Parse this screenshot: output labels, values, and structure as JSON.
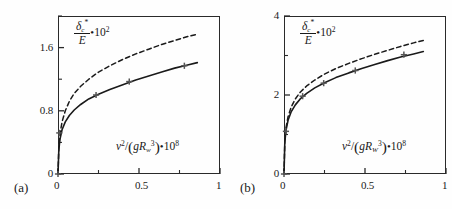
{
  "figure": {
    "panels": [
      {
        "label": "(a)",
        "y_axis": {
          "title_numerator": "δ",
          "title_numerator_sub": "c",
          "title_numerator_sup": "*",
          "title_denominator": "E",
          "title_suffix_dot": "•",
          "title_suffix": "10",
          "title_suffix_exp": "2",
          "ticks": [
            "0",
            "0.8",
            "1.6"
          ],
          "tick_values": [
            0,
            0.8,
            1.6
          ],
          "minor_tick_values": [
            0.4,
            1.2,
            2.0
          ],
          "limits": [
            0,
            2.0
          ]
        },
        "x_axis": {
          "title_var": "v",
          "title_var_exp": "2",
          "title_slash": "/",
          "title_open": "(",
          "title_g": "g",
          "title_R": "R",
          "title_R_sub": "w",
          "title_R_exp": "3",
          "title_close": ")",
          "title_dot": "•",
          "title_ten": "10",
          "title_ten_exp": "8",
          "ticks": [
            "0",
            "0.5",
            "1"
          ],
          "tick_values": [
            0,
            0.5,
            1
          ],
          "minor_tick_values": [
            0.25,
            0.75
          ],
          "limits": [
            0,
            1
          ]
        }
      },
      {
        "label": "(b)",
        "y_axis": {
          "title_numerator": "δ",
          "title_numerator_sub": "c",
          "title_numerator_sup": "*",
          "title_denominator": "E",
          "title_suffix_dot": "•",
          "title_suffix": "10",
          "title_suffix_exp": "2",
          "ticks": [
            "0",
            "2",
            "4"
          ],
          "tick_values": [
            0,
            2,
            4
          ],
          "minor_tick_values": [
            1,
            3
          ],
          "limits": [
            0,
            4
          ]
        },
        "x_axis": {
          "title_var": "v",
          "title_var_exp": "2",
          "title_slash": "/",
          "title_open": "(",
          "title_g": "g",
          "title_R": "R",
          "title_R_sub": "W",
          "title_R_exp": "3",
          "title_close": ")",
          "title_dot": "•",
          "title_ten": "10",
          "title_ten_exp": "8",
          "ticks": [
            "0",
            "0.5",
            "1"
          ],
          "tick_values": [
            0,
            0.5,
            1
          ],
          "minor_tick_values": [
            0.25,
            0.75
          ],
          "limits": [
            0,
            1
          ]
        }
      }
    ],
    "colors": {
      "axis": "#2a2a2a",
      "solid_curve": "#1a1a1a",
      "dashed_curve": "#1a1a1a",
      "marker": "#555555",
      "background": "#fefefe"
    }
  },
  "chart_data": [
    {
      "type": "line",
      "title": "",
      "panel": "(a)",
      "xlabel": "v^2/(gR_w^3)•10^8",
      "ylabel": "δ*_c/E•10^2",
      "xlim": [
        0,
        1
      ],
      "ylim": [
        0,
        2.0
      ],
      "xticks": [
        0,
        0.5,
        1
      ],
      "yticks": [
        0,
        0.8,
        1.6
      ],
      "grid": false,
      "legend": "none",
      "series": [
        {
          "name": "experimental (solid, with + markers)",
          "style": "solid",
          "marker": "plus",
          "x": [
            0.0,
            0.005,
            0.012,
            0.025,
            0.045,
            0.07,
            0.1,
            0.14,
            0.19,
            0.25,
            0.32,
            0.4,
            0.48,
            0.56,
            0.64,
            0.72,
            0.8,
            0.86
          ],
          "y": [
            0.0,
            0.3,
            0.44,
            0.56,
            0.66,
            0.74,
            0.81,
            0.88,
            0.95,
            1.01,
            1.07,
            1.13,
            1.19,
            1.24,
            1.29,
            1.34,
            1.38,
            1.41
          ]
        },
        {
          "name": "theoretical (dashed)",
          "style": "dashed",
          "marker": "none",
          "x": [
            0.0,
            0.005,
            0.012,
            0.025,
            0.045,
            0.07,
            0.1,
            0.14,
            0.19,
            0.25,
            0.32,
            0.4,
            0.48,
            0.56,
            0.64,
            0.72,
            0.8,
            0.86
          ],
          "y": [
            0.0,
            0.33,
            0.5,
            0.66,
            0.8,
            0.92,
            1.02,
            1.11,
            1.2,
            1.29,
            1.37,
            1.45,
            1.52,
            1.58,
            1.64,
            1.69,
            1.74,
            1.77
          ]
        }
      ],
      "markers": {
        "name": "data points",
        "x": [
          0.0,
          0.008,
          0.235,
          0.44,
          0.78
        ],
        "y": [
          0.0,
          0.52,
          1.0,
          1.17,
          1.37
        ]
      }
    },
    {
      "type": "line",
      "title": "",
      "panel": "(b)",
      "xlabel": "v^2/(gR_W^3)•10^8",
      "ylabel": "δ*_c/E•10^2",
      "xlim": [
        0,
        1
      ],
      "ylim": [
        0,
        4
      ],
      "xticks": [
        0,
        0.5,
        1
      ],
      "yticks": [
        0,
        2,
        4
      ],
      "grid": false,
      "legend": "none",
      "series": [
        {
          "name": "experimental (solid, with + markers)",
          "style": "solid",
          "marker": "plus",
          "x": [
            0.0,
            0.005,
            0.012,
            0.025,
            0.045,
            0.07,
            0.1,
            0.14,
            0.19,
            0.25,
            0.32,
            0.4,
            0.48,
            0.56,
            0.64,
            0.72,
            0.8,
            0.86
          ],
          "y": [
            0.0,
            0.8,
            1.1,
            1.36,
            1.58,
            1.75,
            1.9,
            2.04,
            2.18,
            2.31,
            2.44,
            2.56,
            2.67,
            2.77,
            2.87,
            2.96,
            3.04,
            3.1
          ]
        },
        {
          "name": "theoretical (dashed)",
          "style": "dashed",
          "marker": "none",
          "x": [
            0.0,
            0.005,
            0.012,
            0.025,
            0.045,
            0.07,
            0.1,
            0.14,
            0.19,
            0.25,
            0.32,
            0.4,
            0.48,
            0.56,
            0.64,
            0.72,
            0.8,
            0.86
          ],
          "y": [
            0.0,
            0.84,
            1.16,
            1.45,
            1.7,
            1.9,
            2.07,
            2.23,
            2.38,
            2.53,
            2.67,
            2.8,
            2.92,
            3.03,
            3.13,
            3.23,
            3.32,
            3.38
          ]
        }
      ],
      "markers": {
        "name": "data points",
        "x": [
          0.0,
          0.012,
          0.115,
          0.245,
          0.44,
          0.74
        ],
        "y": [
          0.0,
          1.08,
          1.97,
          2.3,
          2.62,
          3.02
        ]
      }
    }
  ]
}
